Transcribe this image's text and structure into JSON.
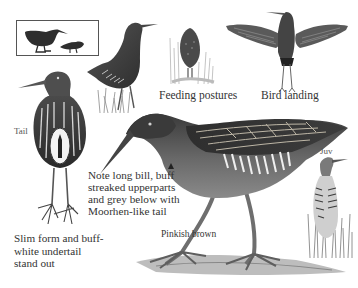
{
  "figure": {
    "palette": {
      "background": "#ffffff",
      "ink_dark": "#2b2b2b",
      "ink_mid": "#6e6e6e",
      "ink_light": "#b8b8b8",
      "text": "#333333"
    }
  },
  "labels": {
    "feeding_postures": "Feeding postures",
    "bird_landing": "Bird landing",
    "tail": "Tail",
    "note": "Note long bill, buff streaked upperparts and grey below with Moorhen-like tail",
    "slim_form": "Slim form and buff-white undertail stand out",
    "pinkish_brown": "Pinkish brown",
    "juv": "Juv"
  },
  "illustrations": [
    {
      "id": "inset-silhouettes",
      "description": "Boxed silhouettes: adult rail and smaller crake-like bird"
    },
    {
      "id": "standing-bird-grass",
      "description": "Rail standing in grass, side view"
    },
    {
      "id": "feeding-posture-rear",
      "description": "Bird seen from behind feeding in reeds"
    },
    {
      "id": "bird-landing",
      "description": "Bird with wings spread, legs dangling"
    },
    {
      "id": "tail-view",
      "description": "Rear view showing striped flanks and white undertail"
    },
    {
      "id": "main-adult",
      "description": "Large adult bird walking, long bill, streaked back"
    },
    {
      "id": "juvenile",
      "description": "Juvenile bird standing in reeds"
    }
  ]
}
